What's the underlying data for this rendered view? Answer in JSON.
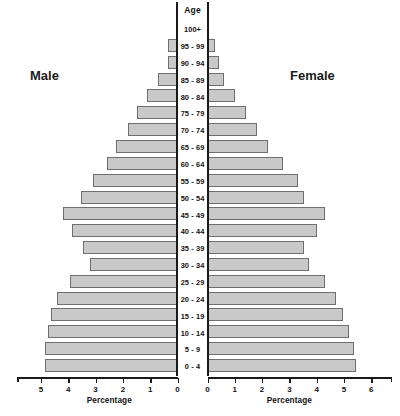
{
  "labels": {
    "age_axis_title": "Age",
    "male_caption": "Male",
    "female_caption": "Female",
    "left_axis_title": "Percentage",
    "right_axis_title": "Percentage"
  },
  "colors": {
    "bar_fill": "#c9c9c9",
    "bar_stroke": "#6f6f6f",
    "axis": "#1a1a1a",
    "text": "#121212",
    "background": "#ffffff"
  },
  "axis": {
    "left_ticks": [
      "5",
      "4",
      "3",
      "2",
      "1",
      "0"
    ],
    "right_ticks": [
      "0",
      "1",
      "2",
      "3",
      "4",
      "5",
      "6"
    ],
    "left_min": 0,
    "left_max": 5.4,
    "right_min": 0,
    "right_max": 6
  },
  "chart_data": {
    "type": "bar",
    "subtype": "population-pyramid",
    "title": "",
    "xlabel": "Percentage",
    "ylabel": "Age",
    "grid": false,
    "legend_position": "inline-sides",
    "categories": [
      "100+",
      "95 - 99",
      "90 - 94",
      "85 - 89",
      "80 - 84",
      "75 - 79",
      "70 - 74",
      "65 - 69",
      "60 - 64",
      "55 - 59",
      "50 - 54",
      "45 - 49",
      "40 - 44",
      "35 - 39",
      "30 - 34",
      "25 - 29",
      "20 - 24",
      "15 - 19",
      "10 - 14",
      "5 - 9",
      "0 - 4"
    ],
    "series": [
      {
        "name": "Male",
        "side": "left",
        "xlim": [
          0,
          5.4
        ],
        "values": [
          0.0,
          0.33,
          0.35,
          0.72,
          1.12,
          1.48,
          1.8,
          2.25,
          2.6,
          3.1,
          3.55,
          4.2,
          3.85,
          3.45,
          3.2,
          3.95,
          4.4,
          4.65,
          4.75,
          4.85,
          4.85
        ]
      },
      {
        "name": "Female",
        "side": "right",
        "xlim": [
          0,
          6
        ],
        "values": [
          0.0,
          0.28,
          0.42,
          0.62,
          1.02,
          1.4,
          1.82,
          2.22,
          2.75,
          3.3,
          3.55,
          4.32,
          4.0,
          3.55,
          3.7,
          4.3,
          4.72,
          4.95,
          5.2,
          5.35,
          5.45
        ]
      }
    ]
  }
}
